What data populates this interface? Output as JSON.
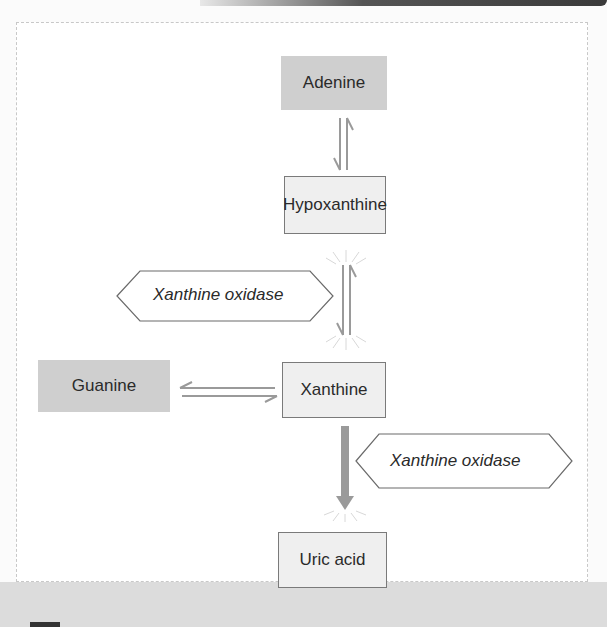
{
  "diagram": {
    "nodes": {
      "adenine": {
        "label": "Adenine",
        "style": "shaded"
      },
      "hypoxanthine": {
        "label": "Hypoxanthine",
        "style": "outlined"
      },
      "guanine": {
        "label": "Guanine",
        "style": "shaded"
      },
      "xanthine": {
        "label": "Xanthine",
        "style": "outlined"
      },
      "uric_acid": {
        "label": "Uric acid",
        "style": "outlined"
      }
    },
    "enzymes": {
      "enzyme_1": {
        "label": "Xanthine oxidase",
        "acts_on": "hypoxanthine-xanthine"
      },
      "enzyme_2": {
        "label": "Xanthine oxidase",
        "acts_on": "xanthine-uric_acid"
      }
    },
    "edges": [
      {
        "from": "Adenine",
        "to": "Hypoxanthine",
        "type": "reversible"
      },
      {
        "from": "Hypoxanthine",
        "to": "Xanthine",
        "type": "reversible",
        "enzyme": "Xanthine oxidase"
      },
      {
        "from": "Guanine",
        "to": "Xanthine",
        "type": "reversible"
      },
      {
        "from": "Xanthine",
        "to": "Uric acid",
        "type": "irreversible",
        "enzyme": "Xanthine oxidase"
      }
    ],
    "colors": {
      "shaded_fill": "#cfcfcf",
      "outlined_fill": "#efefef",
      "arrow": "#9a9a9a",
      "border": "#7a7a7a"
    }
  }
}
